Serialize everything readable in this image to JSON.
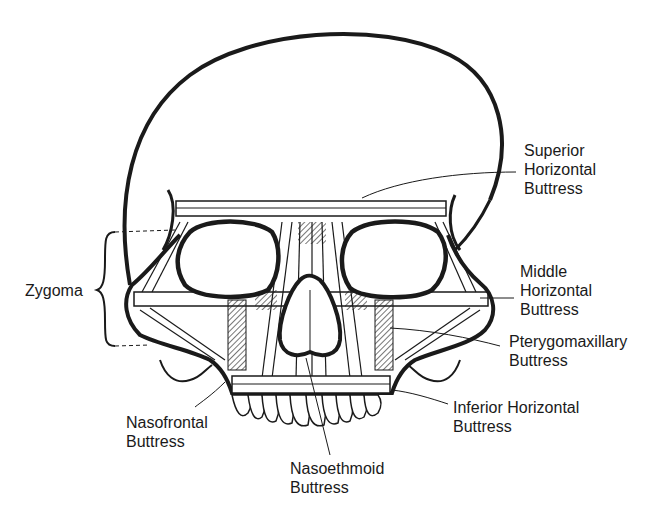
{
  "diagram": {
    "colors": {
      "background": "#ffffff",
      "ink": "#1a1a1a"
    },
    "labels": {
      "superior_horizontal": {
        "line1": "Superior",
        "line2": "Horizontal",
        "line3": "Buttress"
      },
      "middle_horizontal": {
        "line1": "Middle",
        "line2": "Horizontal",
        "line3": "Buttress"
      },
      "pterygomaxillary": {
        "line1": "Pterygomaxillary",
        "line2": "Buttress"
      },
      "inferior_horizontal": {
        "line1": "Inferior Horizontal",
        "line2": "Buttress"
      },
      "nasofrontal": {
        "line1": "Nasofrontal",
        "line2": "Buttress"
      },
      "nasoethmoid": {
        "line1": "Nasoethmoid",
        "line2": "Buttress"
      },
      "zygoma": {
        "line1": "Zygoma"
      }
    }
  }
}
